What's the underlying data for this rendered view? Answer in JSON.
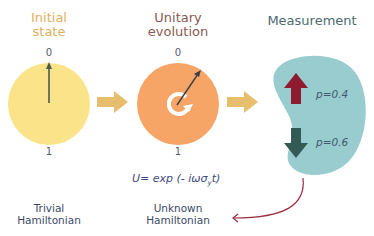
{
  "stages": [
    {
      "title_line1": "Initial",
      "title_line2": "state",
      "top_label": "0",
      "bottom_label": "1",
      "caption_line1": "Trivial",
      "caption_line2": "Hamiltonian",
      "color": "#fbe38a",
      "title_color": "#e0b060"
    },
    {
      "title_line1": "Unitary",
      "title_line2": "evolution",
      "top_label": "0",
      "bottom_label": "1",
      "caption_line1": "Unknown",
      "caption_line2": "Hamiltonian",
      "formula": "U= exp (- iωσ",
      "formula_sub": "y",
      "formula_end": "t)",
      "color": "#f6a566",
      "title_color": "#8a5a52"
    },
    {
      "title": "Measurement",
      "up_probability": "p=0.4",
      "down_probability": "p=0.6",
      "color": "#99cccf",
      "title_color": "#4c6a6e",
      "up_arrow_color": "#8e1b30",
      "down_arrow_color": "#345a56"
    }
  ],
  "flow_arrow_color": "#e7bd6e",
  "feedback_arrow_color": "#9a2a40",
  "state_arrow_color": "#4a5a50"
}
